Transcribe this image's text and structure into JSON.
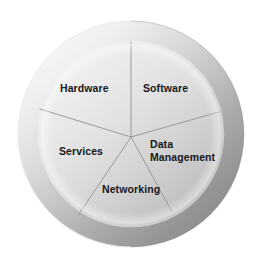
{
  "diagram": {
    "type": "segmented-circle",
    "background_color": "#ffffff",
    "center": {
      "x": 131,
      "y": 134
    },
    "outer_radius": 113,
    "inner_radius": 92,
    "ring": {
      "name": "outer-ring",
      "highlight_color": "#f4f4f4",
      "shadow_color": "#8b8b8b",
      "light_direction": "upper-left"
    },
    "inner_disc": {
      "name": "inner-disc",
      "highlight_color": "#ebebeb",
      "shadow_color": "#bdbdbd"
    },
    "divider_color": "#9a9a9a",
    "label_color": "#16181a",
    "segment_count": 5,
    "segments": [
      {
        "id": "hardware",
        "label": "Hardware",
        "start_angle": -90,
        "end_angle": -17
      },
      {
        "id": "software",
        "label": "Software",
        "start_angle": -17,
        "end_angle": 62
      },
      {
        "id": "data-management",
        "label": "Data\nManagement",
        "start_angle": 62,
        "end_angle": 140
      },
      {
        "id": "networking",
        "label": "Networking",
        "start_angle": 140,
        "end_angle": 215
      },
      {
        "id": "services",
        "label": "Services",
        "start_angle": 215,
        "end_angle": 270
      }
    ]
  }
}
